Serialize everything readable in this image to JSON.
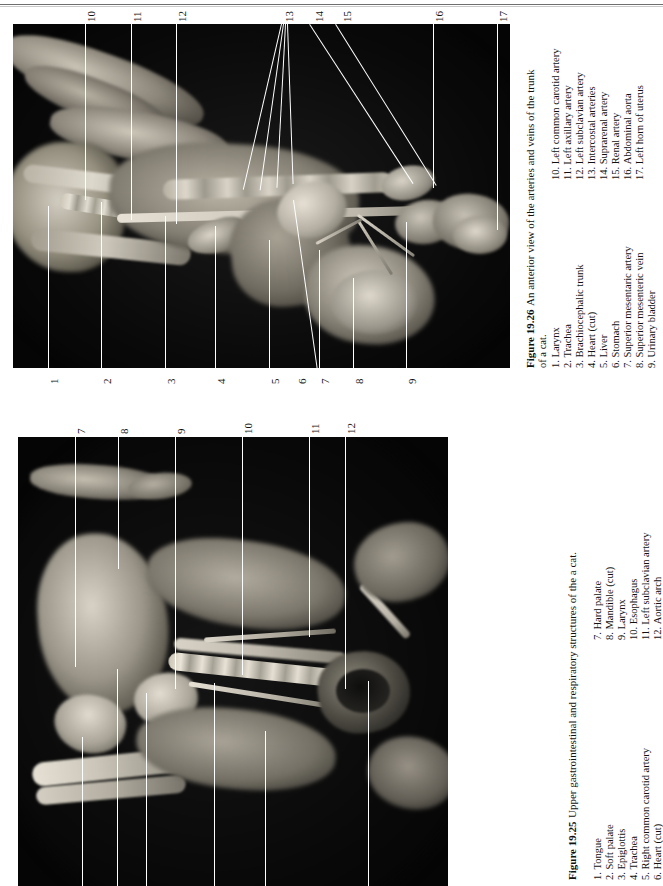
{
  "page": {
    "orientation": "rotated-90-ccw",
    "background": "#ffffff",
    "rule_color": "#6f6f6f"
  },
  "figures": [
    {
      "id": "figure-19-26",
      "number": "Figure 19.26",
      "caption": "An anterior view of the arteries and veins of the trunk of a cat.",
      "caption_part1": "An anterior view of the arteries and veins of the trunk",
      "caption_part2": "of a cat.",
      "legend_left": [
        {
          "num": "1.",
          "label": "Larynx"
        },
        {
          "num": "2.",
          "label": "Trachea"
        },
        {
          "num": "3.",
          "label": "Brachiocephalic trunk"
        },
        {
          "num": "4.",
          "label": "Heart (cut)"
        },
        {
          "num": "5.",
          "label": "Liver"
        },
        {
          "num": "6.",
          "label": "Stomach"
        },
        {
          "num": "7.",
          "label": "Superior mesentaric artery"
        },
        {
          "num": "8.",
          "label": "Superior mesenteric vein"
        },
        {
          "num": "9.",
          "label": "Urinary bladder"
        }
      ],
      "legend_right": [
        {
          "num": "10.",
          "label": "Left common carotid artery"
        },
        {
          "num": "11.",
          "label": "Left axillary artery"
        },
        {
          "num": "12.",
          "label": "Left subclavian artery"
        },
        {
          "num": "13.",
          "label": "Intercostal arteries"
        },
        {
          "num": "14.",
          "label": "Suprarenal artery"
        },
        {
          "num": "15.",
          "label": "Renal artery"
        },
        {
          "num": "16.",
          "label": "Abdominal aorta"
        },
        {
          "num": "17.",
          "label": "Left horn of uterus"
        }
      ],
      "callout_numbers_top": [
        "10",
        "11",
        "12",
        "13",
        "14",
        "15",
        "16",
        "17"
      ],
      "callout_numbers_bottom": [
        "1",
        "2",
        "3",
        "4",
        "5",
        "6",
        "7",
        "8",
        "9"
      ]
    },
    {
      "id": "figure-19-25",
      "number": "Figure 19.25",
      "caption": "Upper gastrointestinal and respiratory structures of the a cat.",
      "legend_left": [
        {
          "num": "1.",
          "label": "Tongue"
        },
        {
          "num": "2.",
          "label": "Soft palate"
        },
        {
          "num": "3.",
          "label": "Epiglottis"
        },
        {
          "num": "4.",
          "label": "Trachea"
        },
        {
          "num": "5.",
          "label": "Right common carotid artery"
        },
        {
          "num": "6.",
          "label": "Heart (cut)"
        }
      ],
      "legend_right": [
        {
          "num": "7.",
          "label": "Hard palate"
        },
        {
          "num": "8.",
          "label": "Mandible (cut)"
        },
        {
          "num": "9.",
          "label": "Larynx"
        },
        {
          "num": "10.",
          "label": "Esophagus"
        },
        {
          "num": "11.",
          "label": "Left subclavian artery"
        },
        {
          "num": "12.",
          "label": "Aortic arch"
        }
      ],
      "callout_numbers_top": [
        "7",
        "8",
        "9",
        "10",
        "11",
        "12"
      ],
      "callout_numbers_bottom": [
        "1",
        "2",
        "3",
        "4",
        "5",
        "6"
      ]
    }
  ]
}
